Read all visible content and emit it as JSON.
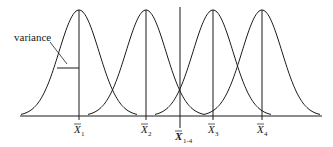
{
  "figure": {
    "annotation_label": "variance",
    "means": [
      {
        "label": "X",
        "subscript": "1",
        "x": 79
      },
      {
        "label": "X",
        "subscript": "2",
        "x": 146
      },
      {
        "label": "X",
        "subscript": "3",
        "x": 213
      },
      {
        "label": "X",
        "subscript": "4",
        "x": 262
      }
    ],
    "grand_mean": {
      "label": "X",
      "subscript": "1-4",
      "x": 180
    },
    "line_color": "#1a1a1a"
  }
}
